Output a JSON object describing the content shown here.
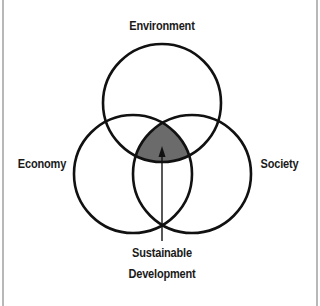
{
  "diagram": {
    "circles": [
      {
        "label": "Environment",
        "cx": 162,
        "cy": 103,
        "r": 59
      },
      {
        "label": "Economy",
        "cx": 133,
        "cy": 174,
        "r": 59
      },
      {
        "label": "Society",
        "cx": 192,
        "cy": 174,
        "r": 59
      }
    ],
    "intersection": {
      "label_line1": "Sustainable",
      "label_line2": "Development",
      "fill": "#6b6b6b"
    },
    "colors": {
      "stroke": "#111111",
      "frame": "#b8b8b8",
      "background": "#ffffff"
    }
  }
}
